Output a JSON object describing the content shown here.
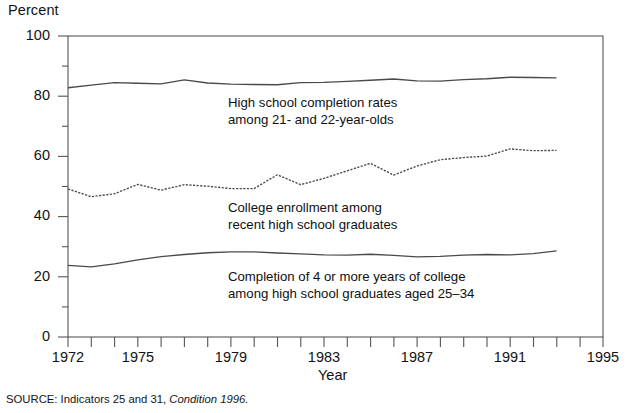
{
  "chart_data": {
    "type": "line",
    "title": "",
    "xlabel": "Year",
    "ylabel": "Percent",
    "xlim": [
      1972,
      1995
    ],
    "ylim": [
      0,
      100
    ],
    "grid": false,
    "legend_position": "inline-annotations",
    "x_tick_labels": [
      "1972",
      "1975",
      "1979",
      "1983",
      "1987",
      "1991",
      "1995"
    ],
    "x_tick_values": [
      1972,
      1975,
      1979,
      1983,
      1987,
      1991,
      1995
    ],
    "y_tick_labels": [
      "0",
      "20",
      "40",
      "60",
      "80",
      "100"
    ],
    "y_tick_values": [
      0,
      20,
      40,
      60,
      80,
      100
    ],
    "y_minor_ticks": [
      10,
      30,
      50,
      70,
      90
    ],
    "x": [
      1972,
      1973,
      1974,
      1975,
      1976,
      1977,
      1978,
      1979,
      1980,
      1981,
      1982,
      1983,
      1984,
      1985,
      1986,
      1987,
      1988,
      1989,
      1990,
      1991,
      1992,
      1993
    ],
    "series": [
      {
        "name": "High school completion rates among 21- and 22-year-olds",
        "style": "solid",
        "values": [
          82.8,
          83.7,
          84.5,
          84.3,
          84.1,
          85.4,
          84.4,
          84.0,
          83.9,
          83.8,
          84.5,
          84.6,
          84.9,
          85.3,
          85.7,
          85.1,
          85.0,
          85.5,
          85.8,
          86.3,
          86.2,
          86.1
        ]
      },
      {
        "name": "College enrollment among recent high school graduates",
        "style": "dotted",
        "values": [
          49.2,
          46.6,
          47.6,
          50.7,
          48.8,
          50.6,
          50.1,
          49.3,
          49.3,
          53.9,
          50.6,
          52.7,
          55.2,
          57.7,
          53.8,
          56.8,
          58.9,
          59.6,
          60.1,
          62.5,
          61.9,
          62.0
        ]
      },
      {
        "name": "Completion of 4 or more years of college among high school graduates aged 25–34",
        "style": "solid",
        "values": [
          23.8,
          23.3,
          24.3,
          25.6,
          26.7,
          27.4,
          28.0,
          28.3,
          28.3,
          27.9,
          27.6,
          27.3,
          27.2,
          27.5,
          27.1,
          26.6,
          26.8,
          27.2,
          27.4,
          27.3,
          27.7,
          28.6
        ]
      }
    ],
    "annotations": [
      {
        "id": "hs",
        "line1": "High school completion rates",
        "line2": "among 21- and 22-year-olds"
      },
      {
        "id": "ce",
        "line1": "College enrollment among",
        "line2": "recent high school graduates"
      },
      {
        "id": "cc",
        "line1": "Completion of 4 or more years of college",
        "line2": "among high school graduates aged 25–34"
      }
    ],
    "source_prefix": "SOURCE:  Indicators 25 and 31,",
    "source_italic": "Condition 1996."
  },
  "colors": {
    "line": "#4a4a4a",
    "axis": "#555555",
    "text": "#101010",
    "background": "#ffffff"
  }
}
